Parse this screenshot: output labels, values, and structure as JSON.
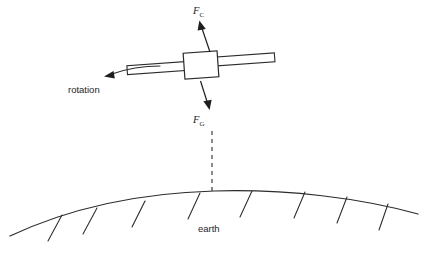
{
  "figure": {
    "background_color": "#ffffff",
    "line_color": "#2b2b2b",
    "text_color": "#1e1e1e",
    "width": 426,
    "height": 262
  },
  "labels": {
    "force_centrifugal": {
      "base": "F",
      "subscript": "C",
      "full": "F_C",
      "meaning": "centrifugal-force",
      "x": 196,
      "y": 13
    },
    "force_gravity": {
      "base": "F",
      "subscript": "G",
      "full": "F_G",
      "meaning": "gravitational-force",
      "x": 196,
      "y": 122
    },
    "rotation": {
      "text": "rotation",
      "x": 69,
      "y": 92
    },
    "earth": {
      "text": "earth",
      "x": 199,
      "y": 231
    }
  },
  "satellite": {
    "body": {
      "x": 185,
      "y": 52,
      "width": 33,
      "height": 25,
      "rotation_deg": -4
    },
    "panel_left": {
      "x": 128,
      "y": 60,
      "width": 58,
      "height": 9,
      "rotation_deg": -4
    },
    "panel_right": {
      "x": 217,
      "y": 56,
      "width": 58,
      "height": 9,
      "rotation_deg": -4
    }
  },
  "arrows": {
    "centrifugal": {
      "from_x": 209,
      "from_y": 52,
      "to_x": 200,
      "to_y": 22,
      "direction": "up-outward"
    },
    "gravity": {
      "from_x": 200,
      "from_y": 80,
      "to_x": 207,
      "to_y": 108,
      "direction": "down-toward-earth"
    },
    "rotation": {
      "direction": "left",
      "tip_x": 107,
      "tip_y": 73
    }
  },
  "earth_surface": {
    "arc_left_x": 12,
    "arc_right_x": 417,
    "arc_peak_x": 214,
    "arc_peak_y": 192,
    "hatch_count": 8,
    "hatch_positions": [
      62,
      96,
      144,
      200,
      250,
      304,
      345,
      385
    ]
  },
  "dashed_connector": {
    "from_x": 212,
    "from_y": 130,
    "to_x": 212,
    "to_y": 196,
    "style": "dashed"
  }
}
